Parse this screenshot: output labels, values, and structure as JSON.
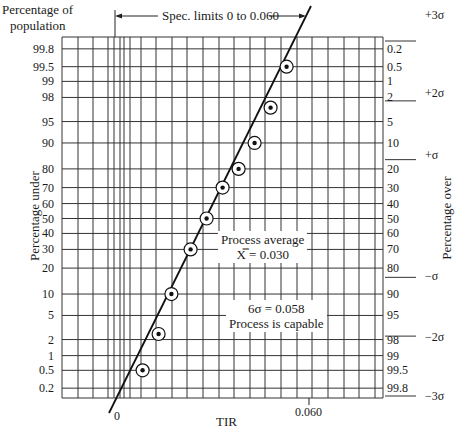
{
  "chart_data": {
    "type": "scatter",
    "subtitle": "Spec. limits 0 to 0.060",
    "xlabel": "TIR",
    "ylabel_left": "Percentage under",
    "ylabel_left_top": "Percentage of population",
    "ylabel_right": "Percentage over",
    "x_ticks": [
      "0",
      "0.060"
    ],
    "y_ticks_left": [
      "99.8",
      "99.5",
      "99",
      "98",
      "95",
      "90",
      "80",
      "70",
      "60",
      "50",
      "40",
      "30",
      "20",
      "10",
      "5",
      "2",
      "1",
      "0.5",
      "0.2"
    ],
    "y_ticks_right": [
      "0.2",
      "0.5",
      "1",
      "2",
      "5",
      "10",
      "20",
      "30",
      "40",
      "50",
      "60",
      "70",
      "80",
      "90",
      "95",
      "98",
      "99",
      "99.5",
      "99.8"
    ],
    "sigma_marks": [
      {
        "label": "+3σ",
        "pct_under": 99.87
      },
      {
        "label": "+2σ",
        "pct_under": 97.7
      },
      {
        "label": "+σ",
        "pct_under": 84.1
      },
      {
        "label": "−σ",
        "pct_under": 15.9
      },
      {
        "label": "−2σ",
        "pct_under": 2.3
      },
      {
        "label": "−3σ",
        "pct_under": 0.13
      }
    ],
    "points": [
      {
        "x": 0.008,
        "pct_under": 0.5
      },
      {
        "x": 0.013,
        "pct_under": 2.5
      },
      {
        "x": 0.017,
        "pct_under": 10
      },
      {
        "x": 0.023,
        "pct_under": 30
      },
      {
        "x": 0.028,
        "pct_under": 50
      },
      {
        "x": 0.033,
        "pct_under": 70
      },
      {
        "x": 0.038,
        "pct_under": 80
      },
      {
        "x": 0.043,
        "pct_under": 90
      },
      {
        "x": 0.048,
        "pct_under": 97
      },
      {
        "x": 0.053,
        "pct_under": 99.5
      }
    ],
    "fit_line": {
      "x_at_0.13pct": 0.001,
      "x_at_99.87pct": 0.059
    },
    "annotations": [
      {
        "text": "Process average",
        "sub": "X̿ = 0.030"
      },
      {
        "text": "6σ = 0.058",
        "sub": "Process is capable"
      }
    ],
    "spec_limits": [
      0,
      0.06
    ],
    "grid": true,
    "legend": "none"
  },
  "labels": {
    "top_left_1": "Percentage of",
    "top_left_2": "population",
    "spec": "Spec. limits 0 to 0.060",
    "x_axis": "TIR",
    "x_zero": "0",
    "x_060": "0.060",
    "left_axis": "Percentage under",
    "right_axis": "Percentage over",
    "avg_title": "Process average",
    "avg_value": "X̿ = 0.030",
    "six_sigma": "6σ = 0.058",
    "capable": "Process is capable",
    "sig_p3": "+3σ",
    "sig_p2": "+2σ",
    "sig_p1": "+σ",
    "sig_m1": "−σ",
    "sig_m2": "−2σ",
    "sig_m3": "−3σ"
  }
}
